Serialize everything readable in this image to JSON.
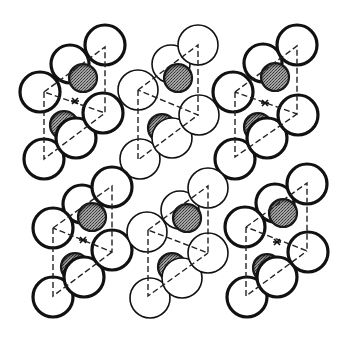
{
  "figure": {
    "width": 348,
    "height": 341,
    "background": "#ffffff"
  },
  "colors": {
    "open_fill": "#ffffff",
    "stroke": "#111111",
    "shaded_fill": "#8a8a8a",
    "shaded_dark": "#3a3a3a",
    "dash": "#222222"
  },
  "legend_symbols": {
    "open_atom": "open circle",
    "shaded_atom": "stippled gray circle",
    "inversion_center": "asterisk"
  },
  "units": [
    {
      "id": "unit-top-left",
      "stroke_width": 3.2,
      "open_atoms": [
        {
          "cx": 105,
          "cy": 45,
          "r": 20
        },
        {
          "cx": 70,
          "cy": 64,
          "r": 19
        },
        {
          "cx": 40,
          "cy": 92,
          "r": 20
        },
        {
          "cx": 103,
          "cy": 113,
          "r": 20
        },
        {
          "cx": 76,
          "cy": 138,
          "r": 20
        },
        {
          "cx": 44,
          "cy": 159,
          "r": 20
        }
      ],
      "shaded_atoms": [
        {
          "cx": 83,
          "cy": 78,
          "r": 14
        },
        {
          "cx": 64,
          "cy": 125,
          "r": 14
        }
      ],
      "dashed_path": "M44,92 L105,47 L105,113 L44,92 M44,92 L44,159 L105,113",
      "center_mark": {
        "x": 75,
        "y": 101
      }
    },
    {
      "id": "unit-top-middle",
      "stroke_width": 1.6,
      "open_atoms": [
        {
          "cx": 198,
          "cy": 45,
          "r": 20
        },
        {
          "cx": 171,
          "cy": 64,
          "r": 19
        },
        {
          "cx": 138,
          "cy": 90,
          "r": 20
        },
        {
          "cx": 199,
          "cy": 115,
          "r": 20
        },
        {
          "cx": 172,
          "cy": 138,
          "r": 20
        },
        {
          "cx": 140,
          "cy": 159,
          "r": 20
        }
      ],
      "shaded_atoms": [
        {
          "cx": 178,
          "cy": 78,
          "r": 14
        },
        {
          "cx": 162,
          "cy": 128,
          "r": 14
        }
      ],
      "dashed_path": "M138,90 L198,45 L198,115 L138,90 M138,90 L138,160 L198,115",
      "center_mark": null
    },
    {
      "id": "unit-top-right",
      "stroke_width": 3.2,
      "open_atoms": [
        {
          "cx": 297,
          "cy": 45,
          "r": 20
        },
        {
          "cx": 263,
          "cy": 63,
          "r": 19
        },
        {
          "cx": 233,
          "cy": 92,
          "r": 20
        },
        {
          "cx": 298,
          "cy": 115,
          "r": 20
        },
        {
          "cx": 267,
          "cy": 138,
          "r": 20
        },
        {
          "cx": 235,
          "cy": 159,
          "r": 20
        }
      ],
      "shaded_atoms": [
        {
          "cx": 275,
          "cy": 77,
          "r": 14
        },
        {
          "cx": 258,
          "cy": 127,
          "r": 14
        }
      ],
      "dashed_path": "M235,92 L297,46 L297,114 L235,92 M235,92 L235,157 L297,114",
      "center_mark": {
        "x": 265,
        "y": 103
      }
    },
    {
      "id": "unit-bottom-left",
      "stroke_width": 3.2,
      "open_atoms": [
        {
          "cx": 112,
          "cy": 187,
          "r": 20
        },
        {
          "cx": 82,
          "cy": 204,
          "r": 19
        },
        {
          "cx": 53,
          "cy": 228,
          "r": 20
        },
        {
          "cx": 112,
          "cy": 250,
          "r": 20
        },
        {
          "cx": 84,
          "cy": 277,
          "r": 20
        },
        {
          "cx": 53,
          "cy": 297,
          "r": 20
        }
      ],
      "shaded_atoms": [
        {
          "cx": 92,
          "cy": 217,
          "r": 14
        },
        {
          "cx": 75,
          "cy": 267,
          "r": 14
        }
      ],
      "dashed_path": "M53,228 L112,186 L112,252 L53,228 M53,228 L53,296 L112,252",
      "center_mark": {
        "x": 83,
        "y": 240
      }
    },
    {
      "id": "unit-bottom-middle",
      "stroke_width": 1.6,
      "open_atoms": [
        {
          "cx": 208,
          "cy": 188,
          "r": 20
        },
        {
          "cx": 180,
          "cy": 210,
          "r": 19
        },
        {
          "cx": 147,
          "cy": 232,
          "r": 20
        },
        {
          "cx": 208,
          "cy": 253,
          "r": 20
        },
        {
          "cx": 182,
          "cy": 278,
          "r": 20
        },
        {
          "cx": 150,
          "cy": 298,
          "r": 20
        }
      ],
      "shaded_atoms": [
        {
          "cx": 187,
          "cy": 218,
          "r": 14
        },
        {
          "cx": 172,
          "cy": 267,
          "r": 14
        }
      ],
      "dashed_path": "M148,230 L208,186 L208,253 L148,230 M148,230 L148,296 L208,253",
      "center_mark": null
    },
    {
      "id": "unit-bottom-right",
      "stroke_width": 3.2,
      "open_atoms": [
        {
          "cx": 307,
          "cy": 184,
          "r": 20
        },
        {
          "cx": 275,
          "cy": 203,
          "r": 19
        },
        {
          "cx": 245,
          "cy": 227,
          "r": 20
        },
        {
          "cx": 308,
          "cy": 252,
          "r": 20
        },
        {
          "cx": 277,
          "cy": 277,
          "r": 20
        },
        {
          "cx": 247,
          "cy": 297,
          "r": 20
        }
      ],
      "shaded_atoms": [
        {
          "cx": 283,
          "cy": 213,
          "r": 14
        },
        {
          "cx": 267,
          "cy": 268,
          "r": 14
        }
      ],
      "dashed_path": "M246,227 L307,183 L307,251 L246,227 M246,227 L246,296 L307,251",
      "center_mark": {
        "x": 277,
        "y": 242
      }
    }
  ]
}
